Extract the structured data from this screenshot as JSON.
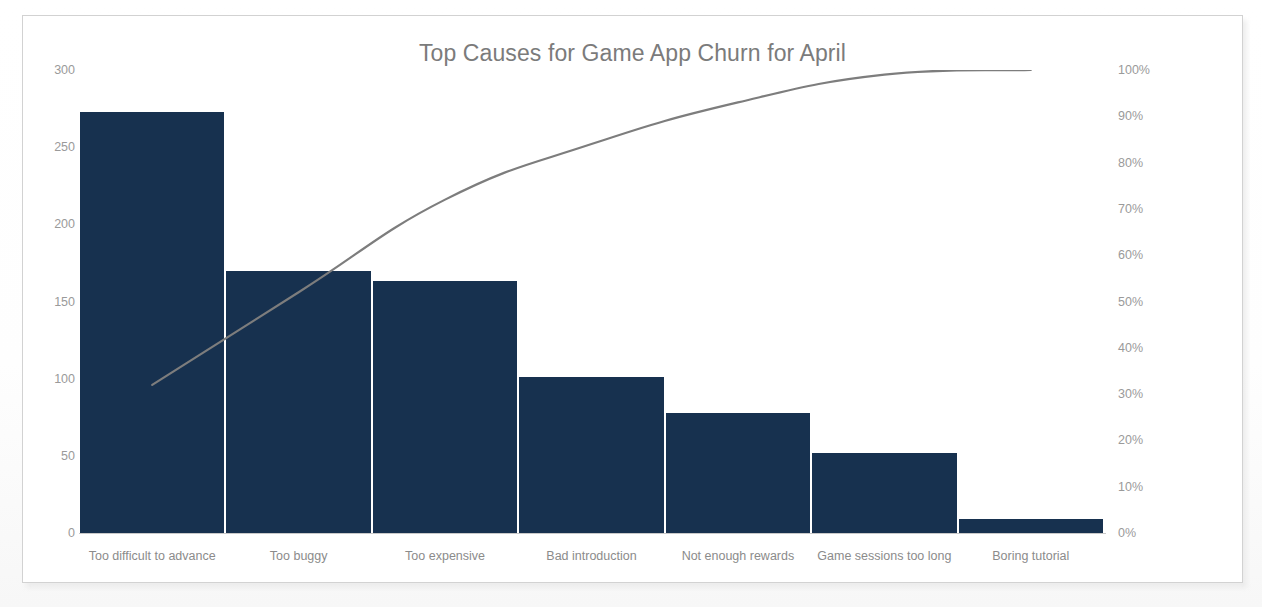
{
  "chart_data": {
    "type": "bar",
    "title": "Top Causes for Game App Churn for April",
    "xlabel": "",
    "ylabel": "",
    "categories": [
      "Too difficult to advance",
      "Too buggy",
      "Too expensive",
      "Bad introduction",
      "Not enough rewards",
      "Game sessions too long",
      "Boring tutorial"
    ],
    "values": [
      273,
      170,
      163,
      101,
      78,
      52,
      9
    ],
    "cumulative_percent": [
      32,
      52,
      72,
      84,
      93,
      99,
      100
    ],
    "ylim": [
      0,
      300
    ],
    "y2lim": [
      0,
      100
    ],
    "y_ticks": [
      "300",
      "250",
      "200",
      "150",
      "100",
      "50",
      "0"
    ],
    "y_tick_values": [
      300,
      250,
      200,
      150,
      100,
      50,
      0
    ],
    "y2_ticks": [
      "100%",
      "90%",
      "80%",
      "70%",
      "60%",
      "50%",
      "40%",
      "30%",
      "20%",
      "10%",
      "0%"
    ],
    "y2_tick_values": [
      100,
      90,
      80,
      70,
      60,
      50,
      40,
      30,
      20,
      10,
      0
    ],
    "grid": false,
    "legend": "none",
    "series": [
      {
        "name": "Churn count",
        "type": "bar",
        "values": [
          273,
          170,
          163,
          101,
          78,
          52,
          9
        ],
        "color": "#17314f",
        "axis": "left"
      },
      {
        "name": "Cumulative %",
        "type": "line",
        "values": [
          32,
          52,
          72,
          84,
          93,
          99,
          100
        ],
        "color": "#7d7d7d",
        "axis": "right",
        "smooth": true
      }
    ]
  },
  "colors": {
    "bar": "#17314f",
    "line": "#7d7d7d",
    "title_text": "#7b7b7b",
    "tick_text": "#9a9a9a",
    "label_text": "#8b8b8b",
    "card_border": "#d2d2d2",
    "card_background": "#ffffff",
    "axis_line": "#c9c9c9"
  }
}
